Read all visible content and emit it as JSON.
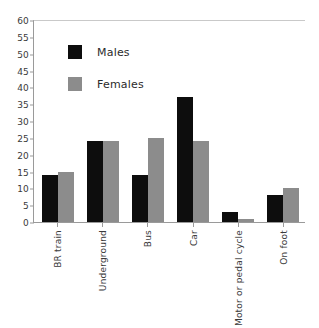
{
  "chart_data": {
    "type": "bar",
    "title": "",
    "xlabel": "",
    "ylabel": "",
    "ylim": [
      0,
      60
    ],
    "ytick_step": 5,
    "yticks": [
      60,
      55,
      50,
      45,
      40,
      35,
      30,
      25,
      20,
      15,
      10,
      5,
      0
    ],
    "grid": false,
    "legend_position": "top-left-inside",
    "categories": [
      "BR train",
      "Underground",
      "Bus",
      "Car",
      "Motor or pedal cycle",
      "On foot"
    ],
    "series": [
      {
        "name": "Males",
        "color": "#0d0d0d",
        "values": [
          14,
          24,
          14,
          37,
          3,
          8
        ]
      },
      {
        "name": "Females",
        "color": "#8c8c8c",
        "values": [
          15,
          24,
          25,
          24,
          1,
          10
        ]
      }
    ]
  },
  "legend": {
    "items": [
      {
        "label": "Males",
        "swatch": "black-square-icon"
      },
      {
        "label": "Females",
        "swatch": "gray-square-icon"
      }
    ]
  },
  "colors": {
    "males": "#0d0d0d",
    "females": "#8c8c8c",
    "axis": "#9a9a9a",
    "top_rule": "#c9c9c9",
    "text": "#3a3a3a",
    "background": "#ffffff"
  }
}
